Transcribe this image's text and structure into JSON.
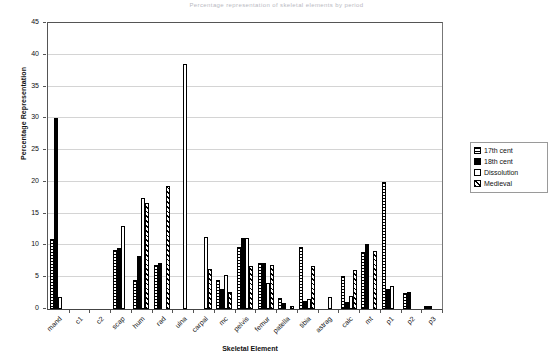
{
  "chart_data": {
    "type": "bar",
    "title": "Percentage representation of skeletal elements by period",
    "xlabel": "Skeletal Element",
    "ylabel": "Percentage Representation",
    "ylim": [
      0,
      45
    ],
    "ytick_step": 5,
    "yticks": [
      0,
      5,
      10,
      15,
      20,
      25,
      30,
      35,
      40,
      45
    ],
    "grid": true,
    "legend_position": "right",
    "categories": [
      "mand",
      "c1",
      "c2",
      "scap",
      "hum",
      "rad",
      "ulna",
      "carpal",
      "mc",
      "pelvis",
      "femur",
      "patella",
      "tibia",
      "astrag",
      "calc",
      "mt",
      "p1",
      "p2",
      "p3"
    ],
    "series": [
      {
        "name": "17th cent",
        "pattern": "horizontal-lines",
        "values": [
          11,
          0,
          0,
          9.3,
          4.5,
          6.9,
          0,
          0,
          4.6,
          9.7,
          7.2,
          1.8,
          9.7,
          0,
          5.2,
          9,
          20,
          2.5,
          0.4
        ]
      },
      {
        "name": "18th cent",
        "pattern": "solid-black",
        "values": [
          30,
          0,
          0,
          9.6,
          8.3,
          7.2,
          0,
          0,
          3.1,
          11.2,
          7.3,
          0.9,
          1.3,
          0,
          1.1,
          10.2,
          3.2,
          2.6,
          0.5
        ]
      },
      {
        "name": "Dissolution",
        "pattern": "white",
        "values": [
          1.9,
          0,
          0,
          13,
          17.5,
          0,
          38.5,
          11.4,
          5.3,
          11.1,
          4.1,
          0,
          1.5,
          1.9,
          2,
          0,
          3.6,
          0,
          0
        ]
      },
      {
        "name": "Medieval",
        "pattern": "diagonal-hatch",
        "values": [
          0,
          0,
          0,
          0,
          16.7,
          19.4,
          0,
          6.3,
          2.7,
          6.7,
          6.9,
          0.5,
          6.7,
          0,
          6.2,
          9.1,
          0,
          0,
          0
        ]
      }
    ]
  },
  "legend": {
    "items": [
      {
        "label": "17th cent",
        "pattern": "horizontal-lines"
      },
      {
        "label": "18th cent",
        "pattern": "solid-black"
      },
      {
        "label": "Dissolution",
        "pattern": "white"
      },
      {
        "label": "Medieval",
        "pattern": "diagonal-hatch"
      }
    ]
  }
}
